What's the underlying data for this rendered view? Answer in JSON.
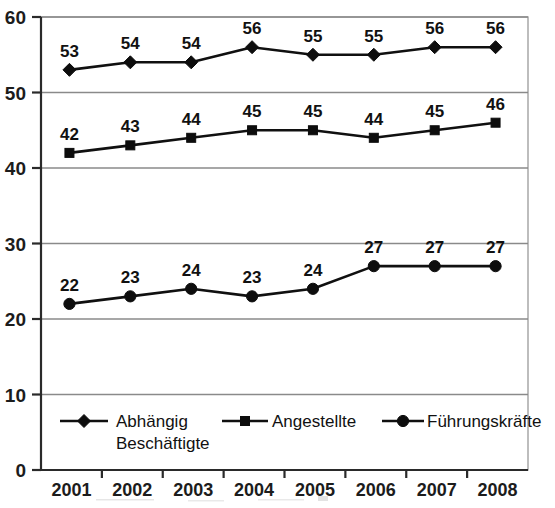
{
  "chart_data": {
    "type": "line",
    "title": "",
    "subtitle": "",
    "xlabel": "",
    "ylabel": "",
    "categories": [
      "2001",
      "2002",
      "2003",
      "2004",
      "2005",
      "2006",
      "2007",
      "2008"
    ],
    "x": [
      2001,
      2002,
      2003,
      2004,
      2005,
      2006,
      2007,
      2008
    ],
    "ylim": [
      0,
      60
    ],
    "yticks": [
      0,
      10,
      20,
      30,
      40,
      50,
      60
    ],
    "ytick_labels": [
      "0",
      "10",
      "20",
      "30",
      "40",
      "50",
      "60"
    ],
    "grid": true,
    "legend_position": "inside-bottom",
    "series": [
      {
        "name": "Abhängig Beschäftigte",
        "marker": "diamond",
        "color": "#101010",
        "values": [
          53,
          54,
          54,
          56,
          55,
          55,
          56,
          56
        ],
        "labels": [
          "53",
          "54",
          "54",
          "56",
          "55",
          "55",
          "56",
          "56"
        ]
      },
      {
        "name": "Angestellte",
        "marker": "square",
        "color": "#101010",
        "values": [
          42,
          43,
          44,
          45,
          45,
          44,
          45,
          46
        ],
        "labels": [
          "42",
          "43",
          "44",
          "45",
          "45",
          "44",
          "45",
          "46"
        ]
      },
      {
        "name": "Führungskräfte",
        "marker": "circle",
        "color": "#101010",
        "values": [
          22,
          23,
          24,
          23,
          24,
          27,
          27,
          27
        ],
        "labels": [
          "22",
          "23",
          "24",
          "23",
          "24",
          "27",
          "27",
          "27"
        ]
      }
    ],
    "legend": [
      {
        "label_line1": "Abhängig",
        "label_line2": "Beschäftigte",
        "marker": "diamond"
      },
      {
        "label_line1": "Angestellte",
        "label_line2": "",
        "marker": "square"
      },
      {
        "label_line1": "Führungskräfte",
        "label_line2": "",
        "marker": "circle"
      }
    ]
  }
}
